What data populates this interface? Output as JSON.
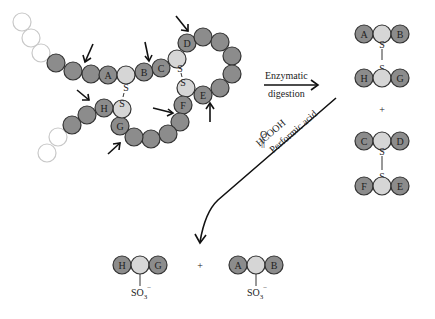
{
  "figure": {
    "residue_labels": [
      "A",
      "B",
      "C",
      "D",
      "E",
      "F",
      "G",
      "H"
    ],
    "disulfide_symbol": "S",
    "colors": {
      "residue_dark": "#8c8c8c",
      "cysteine_light": "#d6d6d6",
      "outline": "#333333",
      "ghost_residue": "#c8c8c8"
    }
  },
  "reaction1": {
    "label_line1": "Enzymatic",
    "label_line2": "digestion"
  },
  "products1": {
    "top": {
      "left": "A",
      "right": "B",
      "bond": "S"
    },
    "bottom": {
      "left": "H",
      "right": "G",
      "bond": "S"
    },
    "plus": "+",
    "second_top": {
      "left": "C",
      "right": "D",
      "bond": "S"
    },
    "second_bottom": {
      "left": "F",
      "right": "E",
      "bond": "S"
    }
  },
  "reaction2": {
    "reagent_o": "O",
    "reagent_dbl": "||",
    "reagent_formula": "HCOOH",
    "reagent_name": "Performic acid"
  },
  "products2": {
    "left": {
      "left": "H",
      "right": "G",
      "group": "SO₃⁻"
    },
    "plus": "+",
    "right": {
      "left": "A",
      "right": "B",
      "group": "SO₃⁻"
    }
  }
}
